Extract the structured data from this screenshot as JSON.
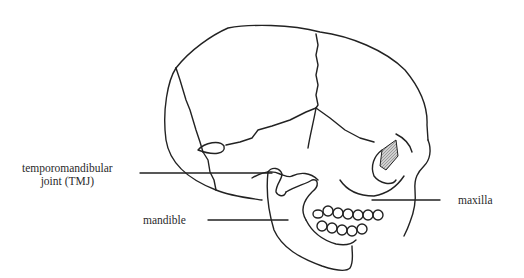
{
  "diagram": {
    "colors": {
      "stroke": "#222222",
      "background": "#ffffff",
      "shade": "#bdbdbd"
    },
    "labels": [
      {
        "id": "tmj",
        "line1": "temporomandibular",
        "line2": "joint (TMJ)"
      },
      {
        "id": "mandible",
        "text": "mandible"
      },
      {
        "id": "maxilla",
        "text": "maxilla"
      }
    ]
  }
}
